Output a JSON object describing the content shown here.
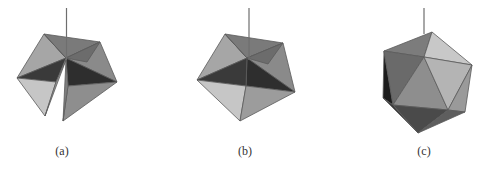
{
  "figure": {
    "panels": [
      {
        "id": "a",
        "label": "(a)",
        "description": "Partially folded net of triangular faces with an open gap at the bottom, with a vertical pole"
      },
      {
        "id": "b",
        "label": "(b)",
        "description": "Pentagonal cap of triangular faces, closed, with a vertical pole"
      },
      {
        "id": "c",
        "label": "(c)",
        "description": "Fully formed icosahedron with a vertical pole at the top vertex"
      }
    ],
    "colors": {
      "background": "#ffffff",
      "face_light": "#c4c4c4",
      "face_mid_light": "#a8a8a8",
      "face_mid": "#8c8c8c",
      "face_mid_dark": "#6e6e6e",
      "face_dark": "#3c3c3c",
      "face_darkest": "#222222",
      "edge": "#5a5a5a",
      "pole": "#6e6e6e"
    }
  }
}
